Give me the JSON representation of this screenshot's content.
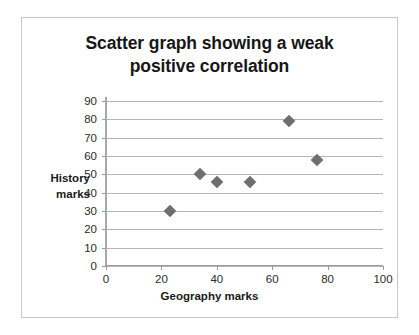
{
  "chart_data": {
    "type": "scatter",
    "title": "Scatter graph showing a weak positive correlation",
    "title_line1": "Scatter graph showing a weak",
    "title_line2": "positive correlation",
    "xlabel": "Geography marks",
    "ylabel": "History marks",
    "ylabel_line1": "History",
    "ylabel_line2": "marks",
    "xlim": [
      0,
      100
    ],
    "ylim": [
      0,
      90
    ],
    "xticks": [
      0,
      20,
      40,
      60,
      80,
      100
    ],
    "yticks": [
      0,
      10,
      20,
      30,
      40,
      50,
      60,
      70,
      80,
      90
    ],
    "grid": "horizontal",
    "legend": "none",
    "marker": "diamond",
    "marker_color": "#6e6e6e",
    "gridline_color": "#b5b5b5",
    "border_color": "#c8c8c8",
    "series": [
      {
        "name": "marks",
        "points": [
          {
            "x": 23,
            "y": 30
          },
          {
            "x": 34,
            "y": 50
          },
          {
            "x": 40,
            "y": 46
          },
          {
            "x": 52,
            "y": 46
          },
          {
            "x": 66,
            "y": 79
          },
          {
            "x": 76,
            "y": 58
          }
        ]
      }
    ]
  }
}
